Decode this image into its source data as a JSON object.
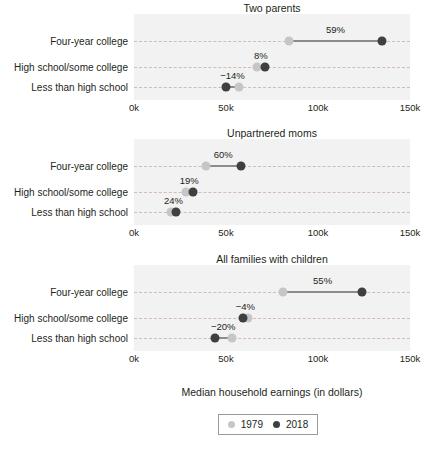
{
  "chart_data": {
    "type": "scatter",
    "subtype": "dumbbell",
    "title": "",
    "xlabel": "Median household earnings (in dollars)",
    "ylabel": "",
    "xlim": [
      0,
      150000
    ],
    "xticks": [
      0,
      50000,
      100000,
      150000
    ],
    "xtick_labels": [
      "0k",
      "50k",
      "100k",
      "150k"
    ],
    "grid": true,
    "legend_position": "bottom",
    "series": [
      {
        "name": "1979",
        "color": "#c6c6c6"
      },
      {
        "name": "2018",
        "color": "#3f3f3f"
      }
    ],
    "categories": [
      "Four-year college",
      "High school/some college",
      "Less than high school"
    ],
    "panels": [
      {
        "title": "Two parents",
        "rows": [
          {
            "category": "Four-year college",
            "v1979": 84000,
            "v2018": 135000,
            "change_label": "59%"
          },
          {
            "category": "High school/some college",
            "v1979": 67000,
            "v2018": 71000,
            "change_label": "8%"
          },
          {
            "category": "Less than high school",
            "v1979": 57000,
            "v2018": 50000,
            "change_label": "−14%"
          }
        ]
      },
      {
        "title": "Unpartnered moms",
        "rows": [
          {
            "category": "Four-year college",
            "v1979": 39000,
            "v2018": 58000,
            "change_label": "60%"
          },
          {
            "category": "High school/some college",
            "v1979": 28000,
            "v2018": 32000,
            "change_label": "19%"
          },
          {
            "category": "Less than high school",
            "v1979": 20000,
            "v2018": 23000,
            "change_label": "24%"
          }
        ]
      },
      {
        "title": "All families with children",
        "rows": [
          {
            "category": "Four-year college",
            "v1979": 81000,
            "v2018": 124000,
            "change_label": "55%"
          },
          {
            "category": "High school/some college",
            "v1979": 62000,
            "v2018": 59000,
            "change_label": "−4%"
          },
          {
            "category": "Less than high school",
            "v1979": 53000,
            "v2018": 44000,
            "change_label": "−20%"
          }
        ]
      }
    ]
  },
  "legend": {
    "items": [
      {
        "label": "1979",
        "color": "#c6c6c6"
      },
      {
        "label": "2018",
        "color": "#3f3f3f"
      }
    ]
  },
  "axis": {
    "title": "Median household earnings (in dollars)",
    "ticks": [
      "0k",
      "50k",
      "100k",
      "150k"
    ]
  }
}
